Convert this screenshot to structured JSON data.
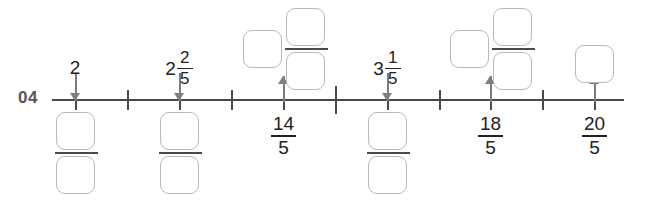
{
  "worksheet": {
    "problem_number": "04",
    "instruction_visible": false
  },
  "number_line": {
    "start_x": 52,
    "end_x": 624,
    "y": 100,
    "tick_spacing": 52,
    "tick_count": 11,
    "ticks": [
      {
        "index": 0,
        "x": 75,
        "value": "2",
        "style": "minor"
      },
      {
        "index": 1,
        "x": 127,
        "value": "11/5",
        "style": "minor"
      },
      {
        "index": 2,
        "x": 179,
        "value": "12/5",
        "style": "minor"
      },
      {
        "index": 3,
        "x": 231,
        "value": "13/5",
        "style": "minor"
      },
      {
        "index": 4,
        "x": 283,
        "value": "14/5",
        "style": "minor"
      },
      {
        "index": 5,
        "x": 335,
        "value": "3",
        "style": "major"
      },
      {
        "index": 6,
        "x": 387,
        "value": "16/5",
        "style": "minor"
      },
      {
        "index": 7,
        "x": 439,
        "value": "17/5",
        "style": "minor"
      },
      {
        "index": 8,
        "x": 490,
        "value": "18/5",
        "style": "minor"
      },
      {
        "index": 9,
        "x": 542,
        "value": "19/5",
        "style": "minor"
      },
      {
        "index": 10,
        "x": 594,
        "value": "20/5",
        "style": "minor"
      }
    ]
  },
  "labels": {
    "above": [
      {
        "id": "label-2",
        "x": 75,
        "text": "2",
        "kind": "whole",
        "whole": "2"
      },
      {
        "id": "label-2-2-5",
        "x": 179,
        "text": "2 2/5",
        "kind": "mixed",
        "whole": "2",
        "numerator": "2",
        "denominator": "5"
      },
      {
        "id": "label-3-1-5",
        "x": 387,
        "text": "3 1/5",
        "kind": "mixed",
        "whole": "3",
        "numerator": "1",
        "denominator": "5"
      }
    ],
    "below": [
      {
        "id": "label-14-5",
        "x": 283,
        "kind": "fraction",
        "numerator": "14",
        "denominator": "5"
      },
      {
        "id": "label-18-5",
        "x": 490,
        "kind": "fraction",
        "numerator": "18",
        "denominator": "5"
      },
      {
        "id": "label-20-5",
        "x": 594,
        "kind": "fraction",
        "numerator": "20",
        "denominator": "5"
      }
    ]
  },
  "answers": [
    {
      "id": "answer-below-2",
      "kind": "fraction-boxes",
      "position": "below-line",
      "tick_x": 75,
      "value": "",
      "numerator_value": "",
      "denominator_value": ""
    },
    {
      "id": "answer-below-2-2-5",
      "kind": "fraction-boxes",
      "position": "below-line",
      "tick_x": 179,
      "value": "",
      "numerator_value": "",
      "denominator_value": ""
    },
    {
      "id": "answer-above-14-5",
      "kind": "mixed-number-boxes",
      "position": "above-line",
      "tick_x": 283,
      "whole_value": "",
      "numerator_value": "",
      "denominator_value": ""
    },
    {
      "id": "answer-below-3-1-5",
      "kind": "fraction-boxes",
      "position": "below-line",
      "tick_x": 387,
      "numerator_value": "",
      "denominator_value": ""
    },
    {
      "id": "answer-above-18-5",
      "kind": "mixed-number-boxes",
      "position": "above-line",
      "tick_x": 490,
      "whole_value": "",
      "numerator_value": "",
      "denominator_value": ""
    },
    {
      "id": "answer-above-20-5",
      "kind": "whole-number-box",
      "position": "above-line",
      "tick_x": 594,
      "whole_value": ""
    }
  ],
  "arrows": [
    {
      "id": "arrow-2",
      "x": 75,
      "direction": "down"
    },
    {
      "id": "arrow-2-2-5",
      "x": 179,
      "direction": "down"
    },
    {
      "id": "arrow-14-5",
      "x": 283,
      "direction": "up"
    },
    {
      "id": "arrow-3-1-5",
      "x": 387,
      "direction": "down"
    },
    {
      "id": "arrow-18-5",
      "x": 490,
      "direction": "up"
    },
    {
      "id": "arrow-20-5",
      "x": 594,
      "direction": "up"
    }
  ],
  "colors": {
    "line": "#4a4a4a",
    "arrow": "#7d7d7d",
    "box_border": "#b9b9b9",
    "text": "#222222",
    "problem_number": "#555555",
    "background": "#ffffff"
  }
}
